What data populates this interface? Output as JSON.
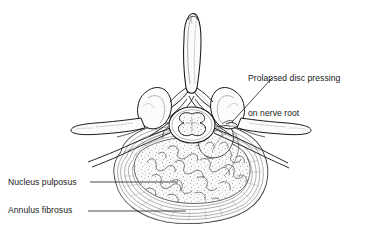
{
  "figure": {
    "kind": "anatomical-line-drawing",
    "background_color": "#ffffff",
    "ink_color": "#1a1a1a",
    "shading_color": "#8f8f8f",
    "light_shading_color": "#c4c4c4"
  },
  "annotations": {
    "prolapsed": {
      "line1": "Prolapsed disc pressing",
      "line2": "on nerve root"
    },
    "nucleus": {
      "text": "Nucleus pulposus"
    },
    "annulus": {
      "text": "Annulus fibrosus"
    }
  },
  "structures": {
    "spinous_process": "spinous-process",
    "transverse_process_left": "transverse-process-left",
    "transverse_process_right": "transverse-process-right",
    "superior_articular_process_left": "superior-articular-process-left",
    "superior_articular_process_right": "superior-articular-process-right",
    "spinal_cord": "spinal-cord",
    "gray_matter": "gray-matter-butterfly",
    "nerve_root_left": "nerve-root-left",
    "nerve_root_right": "nerve-root-right",
    "disc_prolapse": "disc-prolapse-herniation",
    "annulus_fibrosus": "annulus-fibrosus-rings",
    "nucleus_pulposus": "nucleus-pulposus-core"
  }
}
